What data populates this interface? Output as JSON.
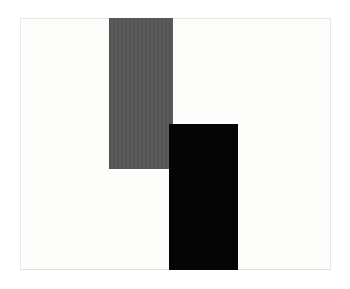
{
  "artwork": {
    "background_color": "#fdfdfc",
    "shapes": [
      {
        "name": "gray-rectangle",
        "color": "#565656",
        "x": 109,
        "y": 18,
        "width": 64,
        "height": 151
      },
      {
        "name": "black-rectangle",
        "color": "#050505",
        "x": 169,
        "y": 124,
        "width": 69,
        "height": 146
      }
    ]
  }
}
